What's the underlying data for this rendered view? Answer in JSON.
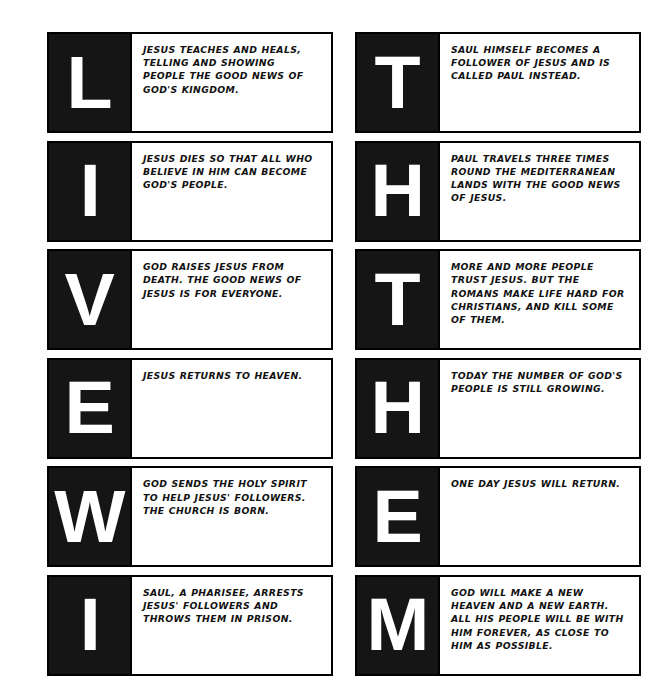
{
  "page": {
    "background_color": "#ffffff",
    "panel_color": "#151515",
    "text_color": "#111111",
    "border_color": "#000000",
    "columns": 2,
    "rows": 6
  },
  "cards": [
    {
      "column": "left",
      "row": 1,
      "letter": "L",
      "text": "JESUS TEACHES AND HEALS, TELLING AND SHOWING PEOPLE THE GOOD NEWS OF GOD'S KINGDOM."
    },
    {
      "column": "left",
      "row": 2,
      "letter": "I",
      "text": "JESUS DIES SO THAT ALL WHO BELIEVE IN HIM CAN BECOME GOD'S PEOPLE."
    },
    {
      "column": "left",
      "row": 3,
      "letter": "V",
      "text": "GOD RAISES JESUS FROM DEATH. THE GOOD NEWS OF JESUS IS FOR EVERYONE."
    },
    {
      "column": "left",
      "row": 4,
      "letter": "E",
      "text": "JESUS RETURNS TO HEAVEN."
    },
    {
      "column": "left",
      "row": 5,
      "letter": "W",
      "text": "GOD SENDS THE HOLY SPIRIT TO HELP JESUS' FOLLOWERS. THE CHURCH IS BORN."
    },
    {
      "column": "left",
      "row": 6,
      "letter": "I",
      "text": "SAUL, A PHARISEE, ARRESTS JESUS' FOLLOWERS AND THROWS THEM IN PRISON."
    },
    {
      "column": "right",
      "row": 1,
      "letter": "T",
      "text": "SAUL HIMSELF BECOMES A FOLLOWER OF JESUS AND IS CALLED PAUL INSTEAD."
    },
    {
      "column": "right",
      "row": 2,
      "letter": "H",
      "text": "PAUL TRAVELS THREE TIMES ROUND THE MEDITERRANEAN LANDS WITH THE GOOD NEWS OF JESUS."
    },
    {
      "column": "right",
      "row": 3,
      "letter": "T",
      "text": "MORE AND MORE PEOPLE TRUST JESUS. BUT THE ROMANS MAKE LIFE HARD FOR CHRISTIANS, AND KILL SOME OF THEM."
    },
    {
      "column": "right",
      "row": 4,
      "letter": "H",
      "text": "TODAY THE NUMBER OF GOD'S PEOPLE IS STILL GROWING."
    },
    {
      "column": "right",
      "row": 5,
      "letter": "E",
      "text": "ONE DAY JESUS WILL RETURN."
    },
    {
      "column": "right",
      "row": 6,
      "letter": "M",
      "text": "GOD WILL MAKE A NEW HEAVEN AND A NEW EARTH. ALL HIS PEOPLE WILL BE WITH HIM FOREVER, AS CLOSE TO HIM AS POSSIBLE."
    }
  ]
}
